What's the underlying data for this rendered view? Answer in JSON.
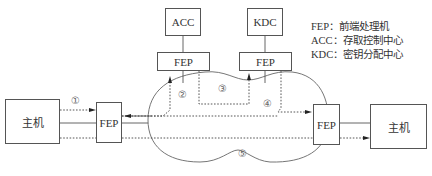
{
  "diagram": {
    "boxes": {
      "acc": "ACC",
      "kdc": "KDC",
      "fep_acc": "FEP",
      "fep_kdc": "FEP",
      "fep_left": "FEP",
      "fep_right": "FEP",
      "host_left": "主机",
      "host_right": "主机"
    },
    "legend": [
      {
        "abbr": "FEP",
        "sep": "：",
        "desc": "前端处理机"
      },
      {
        "abbr": "ACC",
        "sep": "：",
        "desc": "存取控制中心"
      },
      {
        "abbr": "KDC",
        "sep": "：",
        "desc": "密钥分配中心"
      }
    ],
    "steps": [
      "①",
      "②",
      "③",
      "④",
      "⑤"
    ],
    "colors": {
      "line": "#555555",
      "dotted": "#444444",
      "text": "#333333"
    }
  }
}
